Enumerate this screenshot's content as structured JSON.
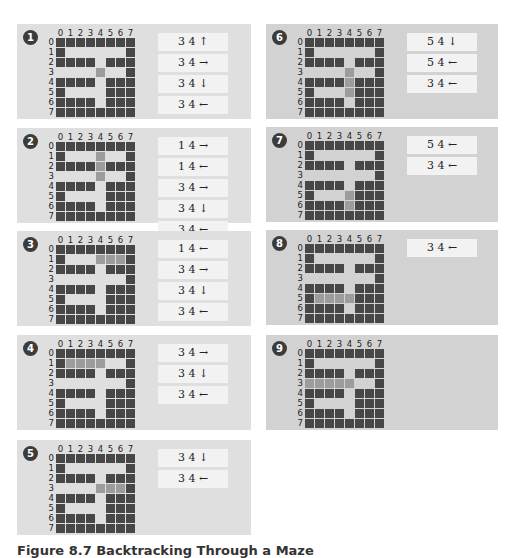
{
  "figure": {
    "caption": "Figure 8.7   Backtracking Through a Maze",
    "col_labels": [
      "0",
      "1",
      "2",
      "3",
      "4",
      "5",
      "6",
      "7"
    ],
    "row_labels": [
      "0",
      "1",
      "2",
      "3",
      "4",
      "5",
      "6",
      "7"
    ],
    "legend": {
      "wall": "#474747",
      "open": "transparent",
      "path": "#9c9c9c"
    },
    "colors": {
      "left_panel_bg": "#dfdfdf",
      "right_panel_bg": "#d2d2d2",
      "stack_frame_bg": "#f2f2f2",
      "badge_bg": "#3b3b3b"
    }
  },
  "panels": [
    {
      "number": "1",
      "highlight": [
        [
          3,
          4
        ]
      ],
      "open_overrides": [],
      "stack": [
        "3 4 ↑",
        "3 4 →",
        "3 4 ↓",
        "3 4 ←"
      ]
    },
    {
      "number": "2",
      "highlight": [
        [
          1,
          4
        ],
        [
          2,
          4
        ],
        [
          3,
          4
        ]
      ],
      "open_overrides": [],
      "stack": [
        "1 4 →",
        "1 4 ←",
        "3 4 →",
        "3 4 ↓",
        "3 4 ←"
      ]
    },
    {
      "number": "3",
      "highlight": [
        [
          1,
          4
        ],
        [
          1,
          5
        ],
        [
          1,
          6
        ]
      ],
      "open_overrides": [],
      "stack": [
        "1 4 ←",
        "3 4 →",
        "3 4 ↓",
        "3 4 ←"
      ]
    },
    {
      "number": "4",
      "highlight": [
        [
          1,
          1
        ],
        [
          1,
          2
        ],
        [
          1,
          3
        ],
        [
          1,
          4
        ]
      ],
      "open_overrides": [],
      "stack": [
        "3 4 →",
        "3 4 ↓",
        "3 4 ←"
      ]
    },
    {
      "number": "5",
      "highlight": [
        [
          3,
          4
        ],
        [
          3,
          5
        ],
        [
          3,
          6
        ]
      ],
      "open_overrides": [],
      "stack": [
        "3 4 ↓",
        "3 4 ←"
      ]
    },
    {
      "number": "6",
      "highlight": [
        [
          3,
          4
        ],
        [
          4,
          4
        ],
        [
          5,
          4
        ]
      ],
      "open_overrides": [],
      "stack": [
        "5 4 ↓",
        "5 4 ←",
        "3 4 ←"
      ]
    },
    {
      "number": "7",
      "highlight": [
        [
          5,
          4
        ],
        [
          6,
          4
        ]
      ],
      "open_overrides": [],
      "stack": [
        "5 4 ←",
        "3 4 ←"
      ]
    },
    {
      "number": "8",
      "highlight": [
        [
          5,
          1
        ],
        [
          5,
          2
        ],
        [
          5,
          3
        ],
        [
          5,
          4
        ]
      ],
      "open_overrides": [],
      "stack": [
        "3 4 ←"
      ]
    },
    {
      "number": "9",
      "highlight": [
        [
          3,
          0
        ],
        [
          3,
          1
        ],
        [
          3,
          2
        ],
        [
          3,
          3
        ],
        [
          3,
          4
        ]
      ],
      "open_overrides": [],
      "stack": []
    }
  ],
  "maze": [
    "########",
    "#......#",
    "####.###",
    ".......#",
    "####.###",
    "#....###",
    "####.###",
    "########"
  ]
}
